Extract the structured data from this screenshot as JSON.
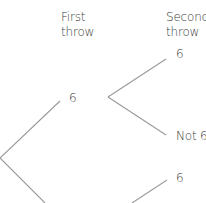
{
  "headers": {
    "first": [
      "First",
      "throw"
    ],
    "second": [
      "Second",
      "throw"
    ]
  },
  "nodes": {
    "first_six": "6",
    "second_six_top": "6",
    "second_not_six": "Not 6",
    "second_six_bottom": "6"
  },
  "colors": {
    "line": "#9a9a9a",
    "text": "#3a3a3a"
  }
}
